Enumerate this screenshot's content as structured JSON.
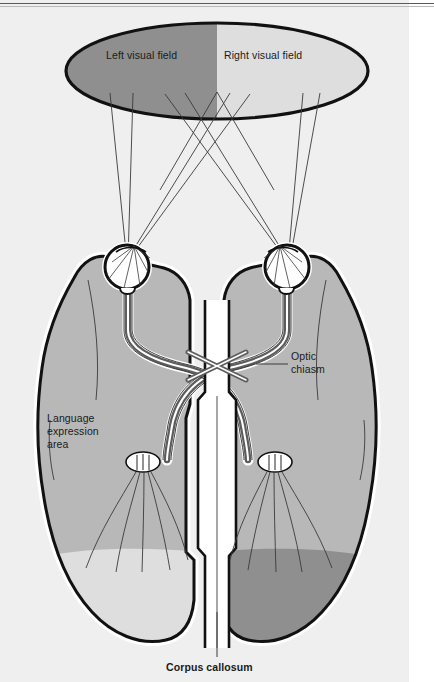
{
  "figure": {
    "domain": "Diagram",
    "title_visible": false,
    "background_color": "#efefef",
    "page_color": "#ffffff"
  },
  "palette": {
    "dark_gray": "#8f8f8f",
    "mid_gray": "#b8b8b8",
    "light_gray": "#dedede",
    "plate_gray": "#efefef",
    "white": "#ffffff",
    "outline_black": "#111111",
    "nerve_dark": "#5d5d5d",
    "thin_line": "#3a3a3a"
  },
  "visual_field": {
    "ellipse": {
      "center_x": 217,
      "center_y": 71,
      "radius_x": 151,
      "radius_y": 48,
      "stroke_color": "#111111",
      "stroke_width": 3.2
    },
    "halves": [
      {
        "name": "left-visual-field",
        "label": "Left visual field",
        "fill": "#8f8f8f",
        "label_x": 106,
        "label_y": 49
      },
      {
        "name": "right-visual-field",
        "label": "Right visual field",
        "fill": "#dedede",
        "label_x": 222,
        "label_y": 49
      }
    ]
  },
  "labels": [
    {
      "name": "optic-chiasm-label",
      "text": "Optic\nchiasm",
      "x": 291,
      "y": 349,
      "bold": false,
      "leader": {
        "x1": 258,
        "y1": 364,
        "x2": 288,
        "y2": 364
      }
    },
    {
      "name": "language-expression-area-label",
      "text": "Language\nexpression\narea",
      "x": 47,
      "y": 411,
      "bold": false,
      "leader": null
    },
    {
      "name": "corpus-callosum-label",
      "text": "Corpus callosum",
      "x": 166,
      "y": 665,
      "bold": true,
      "leader": {
        "x1": 217,
        "y1": 610,
        "x2": 217,
        "y2": 657
      }
    }
  ],
  "label_texts": {
    "left_visual_field": "Left visual field",
    "right_visual_field": "Right visual field",
    "optic_chiasm_line1": "Optic",
    "optic_chiasm_line2": "chiasm",
    "language_line1": "Language",
    "language_line2": "expression",
    "language_line3": "area",
    "corpus_callosum": "Corpus callosum"
  },
  "anatomy": {
    "eyes": [
      {
        "name": "left-eye",
        "cx": 127,
        "cy": 267,
        "r": 22
      },
      {
        "name": "right-eye",
        "cx": 287,
        "cy": 267,
        "r": 22
      }
    ],
    "lateral_geniculate_bodies": [
      {
        "name": "left-lateral-geniculate-body",
        "cx": 143,
        "cy": 462,
        "rx": 17,
        "ry": 10
      },
      {
        "name": "right-lateral-geniculate-body",
        "cx": 275,
        "cy": 462,
        "rx": 17,
        "ry": 10
      }
    ],
    "optic_chiasm": {
      "name": "optic-chiasm",
      "cx": 217,
      "cy": 364
    },
    "hemispheres": [
      {
        "name": "left-hemisphere",
        "fill": "#b8b8b8",
        "occipital_fill": "#dedede"
      },
      {
        "name": "right-hemisphere",
        "fill": "#b8b8b8",
        "occipital_fill": "#8f8f8f"
      }
    ],
    "corpus_callosum": {
      "name": "corpus-callosum",
      "cx": 217,
      "cy": 560
    }
  },
  "light_rays": {
    "count": 8,
    "description": "Light rays projected from the visual field ellipse to each eye, crossing between the fields."
  }
}
